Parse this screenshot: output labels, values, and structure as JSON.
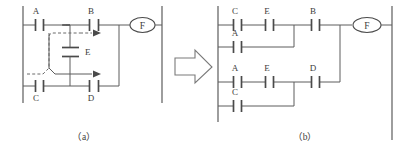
{
  "figure": {
    "kind": "ladder-logic-bridge-circuit-conversion",
    "captions": {
      "left": "（a）",
      "right": "（b）"
    },
    "transform_arrow": "right-arrow-icon"
  },
  "diagram_a": {
    "name": "bridge-circuit",
    "contacts": [
      {
        "id": "a-contact-A",
        "label": "A",
        "orientation": "horizontal",
        "label_pos": "above"
      },
      {
        "id": "a-contact-B",
        "label": "B",
        "orientation": "horizontal",
        "label_pos": "above"
      },
      {
        "id": "a-contact-C",
        "label": "C",
        "orientation": "horizontal",
        "label_pos": "below"
      },
      {
        "id": "a-contact-D",
        "label": "D",
        "orientation": "horizontal",
        "label_pos": "below"
      },
      {
        "id": "a-contact-E",
        "label": "E",
        "orientation": "vertical",
        "label_pos": "right"
      }
    ],
    "coil": {
      "id": "a-coil-F",
      "label": "F",
      "shape": "oval"
    },
    "flow_paths": [
      {
        "id": "a-flow-upper",
        "style": "dashed",
        "description": "C through E to B"
      },
      {
        "id": "a-flow-lower",
        "style": "solid",
        "description": "A through E to D"
      }
    ]
  },
  "diagram_b": {
    "name": "expanded-equivalent-circuit",
    "rungs": [
      {
        "id": "b-rung-1",
        "series": [
          {
            "id": "b-contact-C1",
            "label": "C"
          },
          {
            "id": "b-contact-E1",
            "label": "E"
          }
        ],
        "parallel_below": [
          {
            "id": "b-contact-A1",
            "label": "A"
          }
        ],
        "after": [
          {
            "id": "b-contact-B",
            "label": "B"
          }
        ]
      },
      {
        "id": "b-rung-2",
        "series": [
          {
            "id": "b-contact-A2",
            "label": "A"
          },
          {
            "id": "b-contact-E2",
            "label": "E"
          }
        ],
        "parallel_below": [
          {
            "id": "b-contact-C2",
            "label": "C"
          }
        ],
        "after": [
          {
            "id": "b-contact-D",
            "label": "D"
          }
        ]
      }
    ],
    "coil": {
      "id": "b-coil-F",
      "label": "F",
      "shape": "oval"
    }
  },
  "colors": {
    "wire": "#5d5d5d",
    "contact": "#4a4a4a",
    "text": "#3d3d3d",
    "background": "#ffffff"
  }
}
